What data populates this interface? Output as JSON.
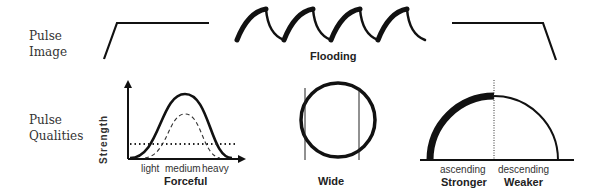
{
  "rows": {
    "pulse_image": {
      "line1": "Pulse",
      "line2": "Image"
    },
    "pulse_qualities": {
      "line1": "Pulse",
      "line2": "Qualities"
    }
  },
  "diagrams": {
    "flooding": {
      "title": "Flooding"
    },
    "forceful": {
      "title": "Forceful",
      "y_axis_label": "Strength",
      "x_ticks": [
        "light",
        "medium",
        "heavy"
      ]
    },
    "wide": {
      "title": "Wide"
    },
    "stronger_weaker": {
      "left_sub": "ascending",
      "right_sub": "descending",
      "left_title": "Stronger",
      "right_title": "Weaker"
    }
  }
}
